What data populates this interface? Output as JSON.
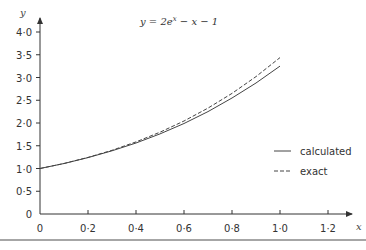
{
  "chart_data": {
    "type": "line",
    "title_display": {
      "y": "y",
      "eq": " = 2e",
      "sup": "x",
      "rest": " − x − 1"
    },
    "xlabel": "x",
    "ylabel": "y",
    "xlim": [
      0,
      1.3
    ],
    "ylim": [
      0,
      4.2
    ],
    "x_ticks": [
      "0",
      "0·2",
      "0·4",
      "0·6",
      "0·8",
      "1·0",
      "1·2"
    ],
    "x_tick_values": [
      0,
      0.2,
      0.4,
      0.6,
      0.8,
      1.0,
      1.2
    ],
    "y_ticks": [
      "0",
      "0·5",
      "1·0",
      "1·5",
      "2·0",
      "2·5",
      "3·0",
      "3·5",
      "4·0"
    ],
    "y_tick_values": [
      0,
      0.5,
      1.0,
      1.5,
      2.0,
      2.5,
      3.0,
      3.5,
      4.0
    ],
    "grid": false,
    "legend_position": "right-center",
    "x": [
      0,
      0.1,
      0.2,
      0.3,
      0.4,
      0.5,
      0.6,
      0.7,
      0.8,
      0.9,
      1.0
    ],
    "series": [
      {
        "name": "calculated",
        "style": "solid",
        "values": [
          1.0,
          1.11,
          1.24,
          1.39,
          1.56,
          1.76,
          1.99,
          2.25,
          2.55,
          2.88,
          3.25
        ]
      },
      {
        "name": "exact",
        "style": "dashed",
        "values": [
          1.0,
          1.11,
          1.243,
          1.4,
          1.584,
          1.797,
          2.044,
          2.328,
          2.651,
          3.019,
          3.437
        ]
      }
    ]
  },
  "legend": {
    "calculated": "calculated",
    "exact": "exact"
  }
}
